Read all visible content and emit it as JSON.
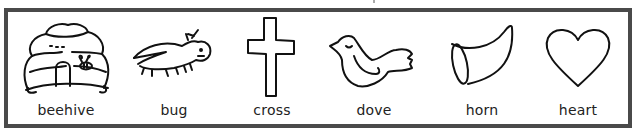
{
  "items": [
    {
      "id": "beehive",
      "label": "beehive",
      "icon": "beehive-icon"
    },
    {
      "id": "bug",
      "label": "bug",
      "icon": "bug-icon"
    },
    {
      "id": "cross",
      "label": "cross",
      "icon": "cross-icon"
    },
    {
      "id": "dove",
      "label": "dove",
      "icon": "dove-icon"
    },
    {
      "id": "horn",
      "label": "horn",
      "icon": "horn-icon"
    },
    {
      "id": "heart",
      "label": "heart",
      "icon": "heart-icon"
    }
  ],
  "colors": {
    "border": "#4a4a4a",
    "ink": "#111111",
    "background": "#ffffff"
  }
}
